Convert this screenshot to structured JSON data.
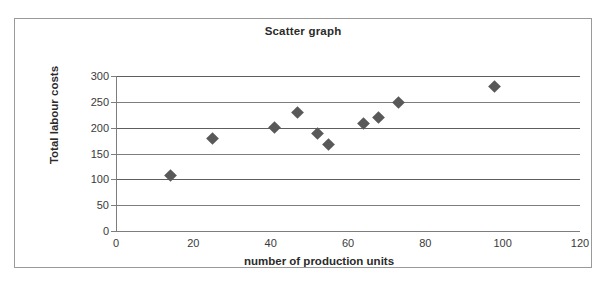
{
  "chart_data": {
    "type": "scatter",
    "title": "Scatter graph",
    "xlabel": "number of production units",
    "ylabel": "Total labour costs",
    "xlim": [
      0,
      120
    ],
    "ylim": [
      0,
      300
    ],
    "xticks": [
      0,
      20,
      40,
      60,
      80,
      100,
      120
    ],
    "yticks": [
      0,
      50,
      100,
      150,
      200,
      250,
      300
    ],
    "grid": "horizontal",
    "legend": "none",
    "series": [
      {
        "name": "Total labour costs vs production units",
        "marker": "diamond",
        "color": "#595959",
        "points": [
          {
            "x": 14,
            "y": 108
          },
          {
            "x": 25,
            "y": 180
          },
          {
            "x": 41,
            "y": 200
          },
          {
            "x": 47,
            "y": 229
          },
          {
            "x": 52,
            "y": 189
          },
          {
            "x": 55,
            "y": 168
          },
          {
            "x": 64,
            "y": 209
          },
          {
            "x": 68,
            "y": 219
          },
          {
            "x": 73,
            "y": 248
          },
          {
            "x": 98,
            "y": 279
          }
        ]
      }
    ]
  },
  "colors": {
    "marker": "#595959",
    "gridline": "#7d7d7d",
    "frame": "#9a9a9a",
    "text": "#2b2b2b"
  }
}
